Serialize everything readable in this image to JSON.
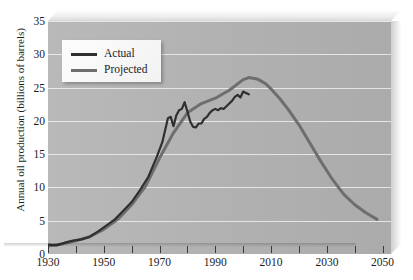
{
  "chart_data": {
    "type": "line",
    "title": "",
    "xlabel": "",
    "ylabel": "Annual oil production (billions of barrels)",
    "xlim": [
      1930,
      2053
    ],
    "ylim": [
      0,
      35
    ],
    "ytick_labels": [
      "0",
      "5",
      "10",
      "15",
      "20",
      "25",
      "30",
      "35"
    ],
    "ytick_values": [
      0,
      5,
      10,
      15,
      20,
      25,
      30,
      35
    ],
    "xtick_labels": [
      "1930",
      "1950",
      "1970",
      "1990",
      "2010",
      "2030",
      "2050"
    ],
    "xtick_values": [
      1930,
      1950,
      1970,
      1990,
      2010,
      2030,
      2050
    ],
    "xminor_values": [
      1940,
      1960,
      1980,
      2000,
      2020,
      2040
    ],
    "grid": "horizontal",
    "legend_position": "upper-left",
    "plot_background": "#b3b3b3",
    "gridline_color": "#efefef",
    "series": [
      {
        "name": "Actual",
        "color": "#2f2f2f",
        "width": 2.2,
        "x": [
          1930,
          1933,
          1936,
          1939,
          1942,
          1945,
          1948,
          1951,
          1954,
          1957,
          1960,
          1963,
          1966,
          1969,
          1971,
          1973,
          1974,
          1975,
          1976,
          1977,
          1978,
          1979,
          1980,
          1981,
          1982,
          1983,
          1984,
          1985,
          1986,
          1987,
          1988,
          1989,
          1990,
          1991,
          1992,
          1993,
          1994,
          1995,
          1996,
          1997,
          1998,
          1999,
          2000,
          2001,
          2002
        ],
        "y": [
          1.4,
          1.3,
          1.7,
          2.0,
          2.2,
          2.6,
          3.4,
          4.3,
          5.2,
          6.5,
          7.8,
          9.6,
          11.6,
          14.6,
          16.8,
          20.4,
          20.6,
          19.2,
          20.8,
          21.6,
          21.8,
          22.8,
          21.4,
          19.9,
          19.1,
          19.0,
          19.6,
          19.6,
          20.3,
          20.6,
          21.2,
          21.6,
          21.8,
          21.6,
          21.9,
          21.8,
          22.2,
          22.6,
          23.0,
          23.6,
          23.9,
          23.5,
          24.4,
          24.2,
          24.0
        ]
      },
      {
        "name": "Projected",
        "color": "#6e6e6e",
        "width": 3.0,
        "x": [
          1930,
          1935,
          1940,
          1945,
          1950,
          1955,
          1960,
          1965,
          1970,
          1975,
          1980,
          1985,
          1990,
          1995,
          2000,
          2002,
          2005,
          2008,
          2010,
          2013,
          2016,
          2020,
          2024,
          2028,
          2032,
          2036,
          2040,
          2044,
          2048
        ],
        "y": [
          1.2,
          1.5,
          2.0,
          2.6,
          3.7,
          5.2,
          7.4,
          10.2,
          14.4,
          18.2,
          21.2,
          22.6,
          23.4,
          24.6,
          26.2,
          26.5,
          26.3,
          25.6,
          24.8,
          23.4,
          21.8,
          19.4,
          16.6,
          13.8,
          11.2,
          9.0,
          7.4,
          6.2,
          5.2
        ]
      }
    ]
  },
  "legend": {
    "entries": [
      {
        "label": "Actual",
        "color": "#2f2f2f"
      },
      {
        "label": "Projected",
        "color": "#6e6e6e"
      }
    ]
  }
}
